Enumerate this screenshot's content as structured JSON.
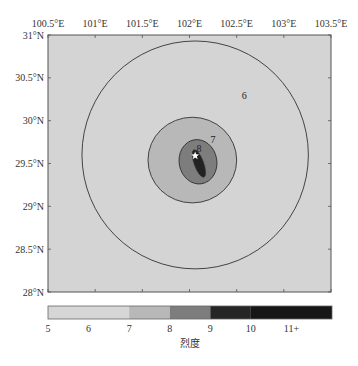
{
  "map": {
    "x_ticks": [
      "100.5°E",
      "101°E",
      "101.5°E",
      "102°E",
      "102.5°E",
      "103°E",
      "103.5°E"
    ],
    "x_values": [
      100.5,
      101,
      101.5,
      102,
      102.5,
      103,
      103.5
    ],
    "y_ticks": [
      "31°N",
      "30.5°N",
      "30°N",
      "29.5°N",
      "29°N",
      "28.5°N",
      "28°N"
    ],
    "y_values": [
      31,
      30.5,
      30,
      29.5,
      29,
      28.5,
      28
    ],
    "lon_range": [
      100.5,
      103.5
    ],
    "lat_range": [
      28,
      31
    ],
    "background_color": "#d4d4d4",
    "epicenter": {
      "lon": 102.06,
      "lat": 29.59,
      "marker": "star-icon"
    },
    "contours": [
      {
        "label": "6",
        "intensity": 6,
        "fill": "#d4d4d4",
        "lon_center": 102.06,
        "lat_center": 29.6,
        "lon_radius": 1.2,
        "lat_radius": 1.33,
        "label_lon": 102.58,
        "label_lat": 30.25
      },
      {
        "label": "7",
        "intensity": 7,
        "fill": "#b8b8b8",
        "lon_center": 102.03,
        "lat_center": 29.54,
        "lon_radius": 0.47,
        "lat_radius": 0.5,
        "label_lon": 102.25,
        "label_lat": 29.74
      },
      {
        "label": "8",
        "intensity": 8,
        "fill": "#7d7d7d",
        "lon_center": 102.09,
        "lat_center": 29.52,
        "lon_radius": 0.2,
        "lat_radius": 0.26,
        "label_lon": 102.1,
        "label_lat": 29.64
      },
      {
        "label": "9",
        "intensity": 9,
        "fill": "#222222",
        "lon_center": 102.1,
        "lat_center": 29.5,
        "lon_radius": 0.05,
        "lat_radius": 0.17,
        "label_lon": null,
        "label_lat": null
      }
    ]
  },
  "colorbar": {
    "title": "烈度",
    "tick_labels": [
      "5",
      "6",
      "7",
      "8",
      "9",
      "10",
      "11+"
    ],
    "segments": [
      {
        "from": 5,
        "to": 7,
        "color": "#d6d6d6"
      },
      {
        "from": 7,
        "to": 8,
        "color": "#b8b8b8"
      },
      {
        "from": 8,
        "to": 9,
        "color": "#7d7d7d"
      },
      {
        "from": 9,
        "to": 10,
        "color": "#262626"
      },
      {
        "from": 10,
        "to": 12,
        "color": "#161616"
      }
    ],
    "range": [
      5,
      12
    ]
  },
  "chart_data": {
    "type": "heatmap",
    "title": "",
    "xlabel": "",
    "ylabel": "",
    "colorbar_label": "烈度",
    "x_range": [
      100.5,
      103.5
    ],
    "y_range": [
      28,
      31
    ],
    "x_tick_labels": [
      "100.5°E",
      "101°E",
      "101.5°E",
      "102°E",
      "102.5°E",
      "103°E",
      "103.5°E"
    ],
    "y_tick_labels": [
      "31°N",
      "30.5°N",
      "30°N",
      "29.5°N",
      "29°N",
      "28.5°N",
      "28°N"
    ],
    "contour_levels": [
      6,
      7,
      8,
      9
    ],
    "colorbar_ticks": [
      "5",
      "6",
      "7",
      "8",
      "9",
      "10",
      "11+"
    ],
    "epicenter": {
      "lon": 102.06,
      "lat": 29.59
    },
    "legend_position": "bottom"
  }
}
